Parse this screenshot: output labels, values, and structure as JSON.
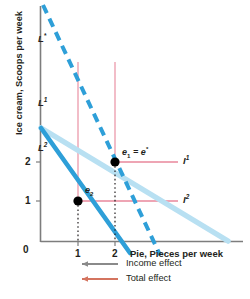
{
  "figure": {
    "y_axis_title": "Ice cream, Scoops per week",
    "x_axis_title": "Pie, Pieces per week",
    "origin_label": "0",
    "y_ticks": [
      "2",
      "1"
    ],
    "x_ticks": [
      "1",
      "2"
    ],
    "budget_line_star_label": "L*",
    "budget_line_1_label": "L1",
    "budget_line_2_label": "L2",
    "indifference_1_label": "I1",
    "indifference_2_label": "I2",
    "point_e1_label": "e1 = e*",
    "point_e2_label": "e2"
  },
  "legend": {
    "income_effect": "Income effect",
    "total_effect": "Total effect"
  },
  "colors": {
    "budget_dark_blue": "#2e9fd8",
    "budget_light_blue": "#b8e0f2",
    "indifference_pink": "#e8879b",
    "guide_pink": "#e8879b",
    "axis_gray": "#7d7d7d",
    "point_black": "#000000",
    "income_arrow": "#8a8a8a",
    "total_arrow": "#d4745f"
  },
  "chart_data": {
    "type": "line",
    "title": "",
    "xlabel": "Pie, Pieces per week",
    "ylabel": "Ice cream, Scoops per week",
    "xlim": [
      0,
      4
    ],
    "ylim": [
      0,
      5
    ],
    "grid": false,
    "legend_position": "below-axis",
    "series": [
      {
        "name": "L*",
        "style": "dashed",
        "color": "#2e9fd8",
        "x": [
          0,
          3.35
        ],
        "y": [
          5.1,
          0
        ]
      },
      {
        "name": "L1",
        "style": "solid-thick-light",
        "color": "#b8e0f2",
        "x": [
          0,
          4.2
        ],
        "y": [
          2.9,
          0
        ]
      },
      {
        "name": "L2",
        "style": "solid-thick",
        "color": "#2e9fd8",
        "x": [
          0,
          2.0
        ],
        "y": [
          2.9,
          0
        ]
      },
      {
        "name": "I1",
        "style": "solid-thin",
        "color": "#e8879b",
        "x": [
          2.0,
          3.6
        ],
        "y": [
          2.0,
          2.0
        ]
      },
      {
        "name": "I2",
        "style": "solid-thin",
        "color": "#e8879b",
        "x": [
          1.0,
          3.6
        ],
        "y": [
          1.0,
          1.0
        ]
      }
    ],
    "points": [
      {
        "label": "e1 = e*",
        "x": 2,
        "y": 2
      },
      {
        "label": "e2",
        "x": 1,
        "y": 1
      }
    ],
    "annotations": [
      {
        "text": "Income effect",
        "type": "legend-arrow"
      },
      {
        "text": "Total effect",
        "type": "legend-arrow"
      }
    ]
  }
}
